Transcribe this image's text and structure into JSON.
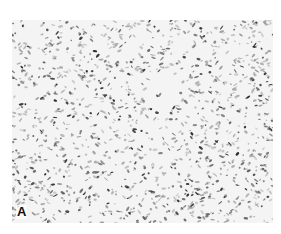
{
  "figure": {
    "panel_label": "A",
    "colors": {
      "background": "#ffffff",
      "tissue": "#f4f4f4",
      "nuclei_dark": "#2a2a2a",
      "nuclei_mid": "#6a6a6a",
      "nuclei_light": "#a8a8a8"
    }
  }
}
